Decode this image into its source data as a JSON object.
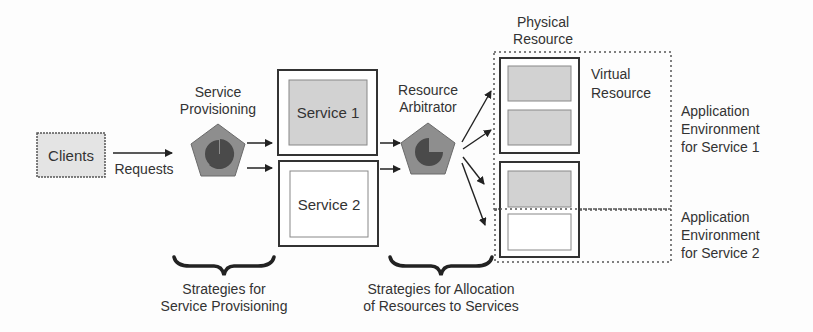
{
  "diagram": {
    "clients": {
      "label": "Clients"
    },
    "requests": {
      "label": "Requests"
    },
    "service_provisioning": {
      "label_line1": "Service",
      "label_line2": "Provisioning",
      "icon": "pentagon-pie-icon"
    },
    "services": [
      {
        "label": "Service 1",
        "fill": "#d2d2d2"
      },
      {
        "label": "Service 2",
        "fill": "#ffffff"
      }
    ],
    "resource_arbitrator": {
      "label_line1": "Resource",
      "label_line2": "Arbitrator",
      "icon": "pentagon-pie-icon"
    },
    "physical_resource": {
      "label_line1": "Physical",
      "label_line2": "Resource"
    },
    "virtual_resource": {
      "label_line1": "Virtual",
      "label_line2": "Resource"
    },
    "app_env_1": {
      "line1": "Application",
      "line2": "Environment",
      "line3": "for Service 1"
    },
    "app_env_2": {
      "line1": "Application",
      "line2": "Environment",
      "line3": "for Service 2"
    },
    "strategy_provisioning": {
      "line1": "Strategies for",
      "line2": "Service Provisioning"
    },
    "strategy_allocation": {
      "line1": "Strategies for Allocation",
      "line2": "of Resources to Services"
    },
    "colors": {
      "pentagon_fill": "#8e8e8e",
      "pie_fill": "#4a4a4a",
      "gray_box": "#d2d2d2",
      "stroke": "#333333"
    }
  }
}
